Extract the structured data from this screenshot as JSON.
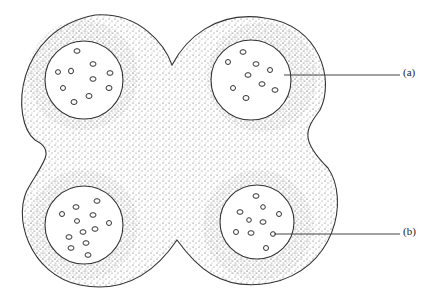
{
  "diagram": {
    "type": "cross-section",
    "labels": [
      {
        "id": "a",
        "text": "(a)",
        "points_to": "upper-right circle interior"
      },
      {
        "id": "b",
        "text": "(b)",
        "points_to": "small cell in lower-right circle"
      }
    ],
    "colors": {
      "outline": "#333333",
      "stipple": "#555555",
      "background": "#ffffff"
    }
  }
}
